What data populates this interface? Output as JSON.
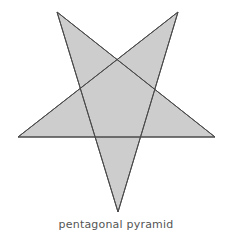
{
  "figure": {
    "caption": "pentagonal pyramid",
    "shape_name": "pentagram-star",
    "background_color": "#ffffff",
    "fill_color": "#cdcdcd",
    "stroke_color": "#4a4a4a",
    "stroke_width": 1,
    "caption_color": "#555555",
    "canvas": {
      "width": 232,
      "height": 244
    },
    "points": {
      "top_left": {
        "x": 57,
        "y": 12
      },
      "top_right": {
        "x": 178,
        "y": 12
      },
      "right": {
        "x": 215,
        "y": 137
      },
      "bottom": {
        "x": 118,
        "y": 212
      },
      "left": {
        "x": 18,
        "y": 137
      }
    },
    "outline_path": "M 57,12 L 215,137 L 18,137 L 178,12 L 118,212 Z",
    "chords": [
      {
        "name": "chord-top-left-to-right",
        "x1": 57,
        "y1": 12,
        "x2": 215,
        "y2": 137
      },
      {
        "name": "chord-right-to-left",
        "x1": 215,
        "y1": 137,
        "x2": 18,
        "y2": 137
      },
      {
        "name": "chord-left-to-top-right",
        "x1": 18,
        "y1": 137,
        "x2": 178,
        "y2": 12
      },
      {
        "name": "chord-top-right-to-bottom",
        "x1": 178,
        "y1": 12,
        "x2": 118,
        "y2": 212
      },
      {
        "name": "chord-bottom-to-top-left",
        "x1": 118,
        "y1": 212,
        "x2": 57,
        "y2": 12
      }
    ]
  }
}
